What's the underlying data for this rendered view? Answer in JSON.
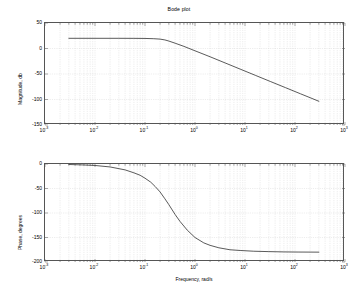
{
  "figure": {
    "title": "Bode plot",
    "width": 358,
    "height": 290,
    "background": "#ffffff",
    "line_color": "#3c3c3c",
    "grid_color": "#bfbfbf",
    "axis_color": "#555555"
  },
  "chart_data": [
    {
      "type": "line",
      "name": "magnitude",
      "title": "Bode plot",
      "xlabel": "",
      "ylabel": "Magnitude, db",
      "xscale": "log",
      "xlim": [
        0.001,
        1000
      ],
      "ylim": [
        -150,
        50
      ],
      "yticks": [
        50,
        0,
        -50,
        -100,
        -150
      ],
      "ytick_labels": [
        "50",
        "0",
        "-50",
        "-100",
        "-150"
      ],
      "xticks": [
        0.001,
        0.01,
        0.1,
        1,
        10,
        100,
        1000
      ],
      "xtick_labels": [
        "10-3",
        "10-2",
        "10-1",
        "100",
        "101",
        "102",
        "103"
      ],
      "xtick_mantissa": "10",
      "xtick_exponents": [
        "-3",
        "-2",
        "-1",
        "0",
        "1",
        "2",
        "3"
      ],
      "grid": true,
      "legend": "none",
      "series": [
        {
          "name": "Magnitude",
          "x": [
            0.003,
            0.01,
            0.03,
            0.06,
            0.1,
            0.15,
            0.2,
            0.25,
            0.3,
            0.4,
            0.6,
            1,
            2,
            4,
            8,
            16,
            32,
            64,
            128,
            200,
            300
          ],
          "y": [
            20,
            20,
            20,
            19.9,
            19.7,
            19.2,
            18.4,
            16.8,
            14.6,
            10.4,
            4.2,
            -4.5,
            -16.2,
            -28.3,
            -40.4,
            -52.5,
            -64.6,
            -76.6,
            -88.7,
            -96.4,
            -103.5
          ]
        }
      ],
      "annotations": {
        "dc_gain_db": 20,
        "corner_frequency_rad_s": 0.2,
        "slope_db_per_decade": -40
      }
    },
    {
      "type": "line",
      "name": "phase",
      "title": "",
      "xlabel": "Frequency, rad/s",
      "ylabel": "Phase, degrees",
      "xscale": "log",
      "xlim": [
        0.001,
        1000
      ],
      "ylim": [
        -200,
        0
      ],
      "yticks": [
        0,
        -50,
        -100,
        -150,
        -200
      ],
      "ytick_labels": [
        "0",
        "-50",
        "-100",
        "-150",
        "-200"
      ],
      "xticks": [
        0.001,
        0.01,
        0.1,
        1,
        10,
        100,
        1000
      ],
      "xtick_labels": [
        "10-3",
        "10-2",
        "10-1",
        "100",
        "101",
        "102",
        "103"
      ],
      "xtick_mantissa": "10",
      "xtick_exponents": [
        "-3",
        "-2",
        "-1",
        "0",
        "1",
        "2",
        "3"
      ],
      "grid": true,
      "legend": "none",
      "series": [
        {
          "name": "Phase",
          "x": [
            0.003,
            0.006,
            0.01,
            0.02,
            0.04,
            0.06,
            0.08,
            0.1,
            0.13,
            0.16,
            0.2,
            0.25,
            0.3,
            0.4,
            0.5,
            0.7,
            1,
            1.5,
            2,
            3,
            5,
            8,
            15,
            30,
            60,
            120,
            200,
            300
          ],
          "y": [
            -1,
            -2,
            -3,
            -6,
            -12,
            -18,
            -23,
            -29,
            -37,
            -46,
            -57,
            -71,
            -83,
            -103,
            -117,
            -135,
            -150,
            -161,
            -166,
            -171,
            -175,
            -176.5,
            -178,
            -178.8,
            -179.4,
            -179.7,
            -179.8,
            -179.9
          ]
        }
      ],
      "annotations": {
        "low_frequency_phase_deg": 0,
        "high_frequency_phase_deg": -180,
        "phase_at_corner_deg": -90
      }
    }
  ]
}
